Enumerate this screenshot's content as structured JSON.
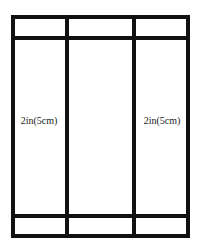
{
  "diagram": {
    "background_color": "#fefefe",
    "line_color": "#111111",
    "fill_color": "#ffffff",
    "columns": [
      {
        "id": "left",
        "top_cell_text": "",
        "body_cell_text": "2in(5cm)",
        "bottom_cell_text": ""
      },
      {
        "id": "middle",
        "top_cell_text": "",
        "body_cell_text": "",
        "bottom_cell_text": ""
      },
      {
        "id": "right",
        "top_cell_text": "",
        "body_cell_text": "2in(5cm)",
        "bottom_cell_text": ""
      }
    ],
    "labels": {
      "left_column": "2in(5cm)",
      "right_column": "2in(5cm)"
    }
  }
}
